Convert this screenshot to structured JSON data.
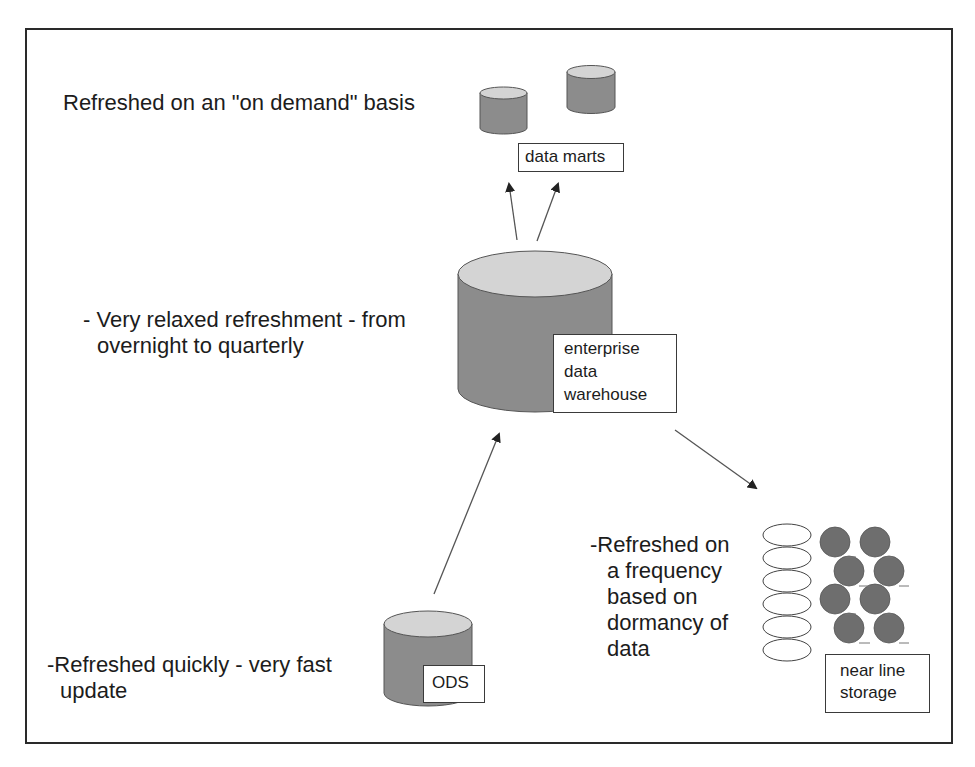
{
  "diagram": {
    "type": "data-warehouse-refresh-architecture",
    "colors": {
      "cylinder_body": "#8c8c8c",
      "cylinder_top": "#d4d4d4",
      "near_line_disk": "#6e6e6e",
      "frame": "#2a2a2a",
      "arrow": "#3a3a3a"
    },
    "nodes": {
      "data_marts": {
        "label": "data marts",
        "icon": "database-cylinder-icon",
        "count": 2
      },
      "edw": {
        "label_lines": [
          "enterprise",
          "data",
          "warehouse"
        ],
        "icon": "database-cylinder-icon"
      },
      "ods": {
        "label": "ODS",
        "icon": "database-cylinder-icon"
      },
      "near_line": {
        "label_lines": [
          "near line",
          "storage"
        ],
        "icon": "tape-disk-stack-icon"
      }
    },
    "annotations": {
      "data_marts": "Refreshed on an \"on demand\" basis",
      "edw": [
        "- Very relaxed refreshment - from",
        "overnight to quarterly"
      ],
      "ods": [
        "-Refreshed quickly - very fast",
        "update"
      ],
      "near_line": [
        "-Refreshed on",
        "a frequency",
        "based on",
        "dormancy of",
        "data"
      ]
    },
    "edges": [
      {
        "from": "edw",
        "to": "data_marts",
        "count": 2
      },
      {
        "from": "ods",
        "to": "edw"
      },
      {
        "from": "edw",
        "to": "near_line"
      }
    ]
  }
}
